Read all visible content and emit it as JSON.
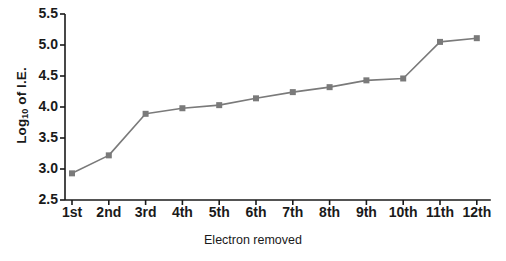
{
  "chart_data": {
    "type": "line",
    "title": "",
    "subtitle": "",
    "xlabel": "Electron removed",
    "ylabel": "Log10 of I.E.",
    "ylabel_base": "Log",
    "ylabel_sub": "10",
    "ylabel_tail": " of I.E.",
    "categories": [
      "1st",
      "2nd",
      "3rd",
      "4th",
      "5th",
      "6th",
      "7th",
      "8th",
      "9th",
      "10th",
      "11th",
      "12th"
    ],
    "values": [
      2.93,
      3.22,
      3.89,
      3.98,
      4.03,
      4.14,
      4.24,
      4.32,
      4.43,
      4.46,
      5.05,
      5.11
    ],
    "series": [
      {
        "name": "Log10 of I.E.",
        "values": [
          2.93,
          3.22,
          3.89,
          3.98,
          4.03,
          4.14,
          4.24,
          4.32,
          4.43,
          4.46,
          5.05,
          5.11
        ]
      }
    ],
    "ylim": [
      2.5,
      5.5
    ],
    "yticks": [
      "2.5",
      "3.0",
      "3.5",
      "4.0",
      "4.5",
      "5.0",
      "5.5"
    ],
    "ytick_values": [
      2.5,
      3.0,
      3.5,
      4.0,
      4.5,
      5.0,
      5.5
    ],
    "grid": false,
    "legend": "none",
    "line_color": "#7a7a7a",
    "marker_color": "#7a7a7a",
    "marker_shape": "square",
    "axis_color": "#1a1a1a",
    "background": "#ffffff"
  }
}
